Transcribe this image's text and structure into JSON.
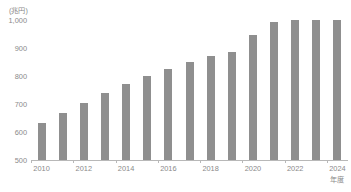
{
  "chart_data": {
    "type": "bar",
    "title": "",
    "unit_label": "(兆円)",
    "xlabel": "年度",
    "ylabel": "",
    "ylim": [
      500,
      1000
    ],
    "ytick_labels": [
      "1,000",
      "900",
      "800",
      "700",
      "600",
      "500"
    ],
    "ytick_values": [
      1000,
      900,
      800,
      700,
      600,
      500
    ],
    "xtick_labels": [
      "2010",
      "2012",
      "2014",
      "2016",
      "2018",
      "2020",
      "2022",
      "2024"
    ],
    "xtick_values": [
      2010,
      2012,
      2014,
      2016,
      2018,
      2020,
      2022,
      2024
    ],
    "grid": false,
    "legend": null,
    "bar_color": "#8f8f8f",
    "axis_color": "#b8b8b8",
    "text_color": "#8a8a8a",
    "categories": [
      "2010",
      "2011",
      "2012",
      "2013",
      "2014",
      "2015",
      "2016",
      "2017",
      "2018",
      "2019",
      "2020",
      "2021",
      "2022",
      "2023",
      "2024"
    ],
    "values": [
      633,
      668,
      704,
      740,
      770,
      800,
      826,
      850,
      871,
      884,
      946,
      993,
      1000,
      1000,
      1000
    ],
    "annotations": []
  },
  "footnote": {
    "text": ""
  }
}
